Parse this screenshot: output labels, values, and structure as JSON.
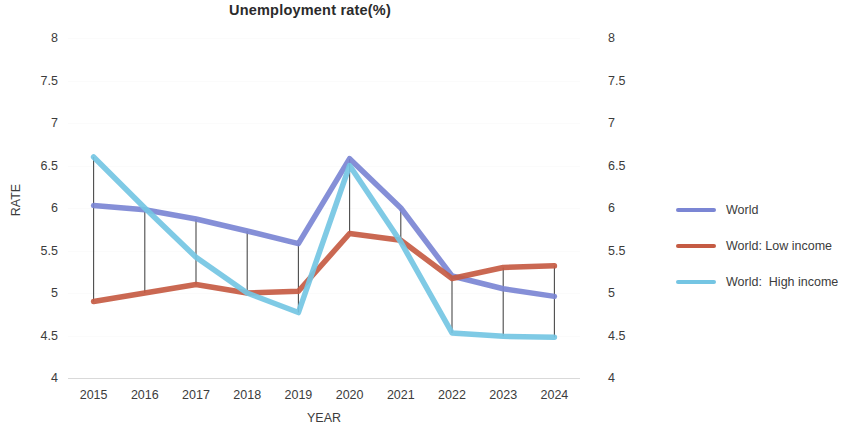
{
  "chart_data": {
    "type": "line",
    "title": "Unemployment rate(%)",
    "xlabel": "YEAR",
    "ylabel": "RATE",
    "categories": [
      "2015",
      "2016",
      "2017",
      "2018",
      "2019",
      "2020",
      "2021",
      "2022",
      "2023",
      "2024"
    ],
    "ylim": [
      4,
      8
    ],
    "yticks": [
      "8",
      "7.5",
      "7",
      "6.5",
      "6",
      "5.5",
      "5",
      "4.5",
      "4"
    ],
    "ytick_values": [
      8,
      7.5,
      7,
      6.5,
      6,
      5.5,
      5,
      4.5,
      4
    ],
    "right_axis": true,
    "right_yticks": [
      "8",
      "7.5",
      "7",
      "6.5",
      "6",
      "5.5",
      "5",
      "4.5",
      "4"
    ],
    "grid": true,
    "legend_position": "right",
    "drop_lines": true,
    "series": [
      {
        "name": "World",
        "color": "#7B86D4",
        "values": [
          6.03,
          5.98,
          5.87,
          5.73,
          5.58,
          6.58,
          6.0,
          5.2,
          5.05,
          4.96
        ]
      },
      {
        "name": "World: Low income",
        "color": "#C55B43",
        "values": [
          4.9,
          5.0,
          5.1,
          5.0,
          5.02,
          5.7,
          5.62,
          5.17,
          5.3,
          5.32
        ]
      },
      {
        "name": "World:  High income",
        "color": "#74C5E3",
        "values": [
          6.6,
          6.0,
          5.42,
          5.0,
          4.77,
          6.5,
          5.6,
          4.53,
          4.49,
          4.48
        ]
      }
    ]
  },
  "legend": {
    "items": [
      {
        "label": "World"
      },
      {
        "label": "World: Low income"
      },
      {
        "label": "World:  High income"
      }
    ]
  }
}
